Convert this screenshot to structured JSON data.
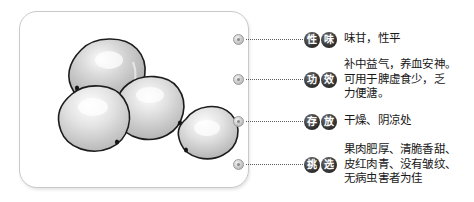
{
  "illustration": {
    "alt_name": "jujube-fruit-illustration",
    "fruit_count": 4,
    "style": "grayscale-line-drawing"
  },
  "colors": {
    "card_border": "#c9c9c9",
    "badge_fill": "#2b2b2b",
    "badge_text": "#ffffff",
    "leader_line": "#5a5a5a",
    "body_text": "#171717",
    "background": "#ffffff"
  },
  "rows": [
    {
      "badge": [
        "性",
        "味"
      ],
      "badge_label": "性味",
      "text": "味甘，性平"
    },
    {
      "badge": [
        "功",
        "效"
      ],
      "badge_label": "功效",
      "text": "补中益气，养血安神。\n可用于脾虚食少，乏\n力便溏。"
    },
    {
      "badge": [
        "存",
        "放"
      ],
      "badge_label": "存放",
      "text": "干燥、阴凉处"
    },
    {
      "badge": [
        "挑",
        "选"
      ],
      "badge_label": "挑选",
      "text": "果肉肥厚、清脆香甜、\n皮红肉青、没有皱纹、\n无病虫害者为佳"
    }
  ]
}
